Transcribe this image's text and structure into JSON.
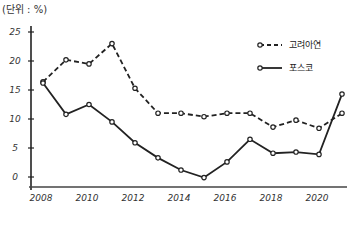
{
  "chart_data": {
    "type": "line",
    "title": "",
    "unit_label": "(단위 : %)",
    "xlabel": "",
    "ylabel": "",
    "x": [
      2008,
      2009,
      2010,
      2011,
      2012,
      2013,
      2014,
      2015,
      2016,
      2017,
      2018,
      2019,
      2020,
      2021
    ],
    "x_tick_labels": [
      "2008",
      "2010",
      "2012",
      "2014",
      "2016",
      "2018",
      "2020"
    ],
    "y_tick_labels": [
      "0",
      "5",
      "10",
      "15",
      "20",
      "25"
    ],
    "ylim": [
      0,
      25
    ],
    "grid": false,
    "legend_position": "upper right",
    "series": [
      {
        "name": "고려아연",
        "style": "dashed",
        "color": "#222222",
        "values": [
          16.4,
          20.2,
          19.5,
          23.0,
          15.3,
          11.0,
          11.0,
          10.4,
          11.0,
          11.0,
          8.6,
          9.8,
          8.4,
          11.0
        ]
      },
      {
        "name": "포스코",
        "style": "solid",
        "color": "#222222",
        "values": [
          16.2,
          10.8,
          12.5,
          9.5,
          5.9,
          3.3,
          1.2,
          -0.1,
          2.6,
          6.5,
          4.1,
          4.3,
          3.9,
          14.3
        ]
      }
    ]
  }
}
